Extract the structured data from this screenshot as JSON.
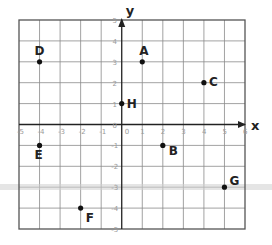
{
  "diagram": {
    "type": "coordinate-grid",
    "x_axis": {
      "label": "x",
      "min": -5,
      "max": 6,
      "ticks": [
        "-5",
        "-4",
        "-3",
        "-2",
        "-1",
        "0",
        "1",
        "2",
        "3",
        "4",
        "5",
        "6"
      ]
    },
    "y_axis": {
      "label": "y",
      "min": -5,
      "max": 5,
      "ticks": [
        "5",
        "4",
        "3",
        "2",
        "1",
        "0",
        "-1",
        "-2",
        "-3",
        "-4",
        "-5"
      ]
    },
    "origin_label": "0",
    "points": [
      {
        "name": "A",
        "x": 1,
        "y": 3
      },
      {
        "name": "B",
        "x": 2,
        "y": -1
      },
      {
        "name": "C",
        "x": 4,
        "y": 2
      },
      {
        "name": "D",
        "x": -4,
        "y": 3
      },
      {
        "name": "E",
        "x": -4,
        "y": -1
      },
      {
        "name": "F",
        "x": -2,
        "y": -4
      },
      {
        "name": "G",
        "x": 5,
        "y": -3
      },
      {
        "name": "H",
        "x": 0,
        "y": 1
      }
    ],
    "colors": {
      "grid": "#8a8a8a",
      "axis": "#222222",
      "point": "#111111",
      "tick": "#9a9a9a",
      "smear": "#c8c8c8"
    }
  }
}
